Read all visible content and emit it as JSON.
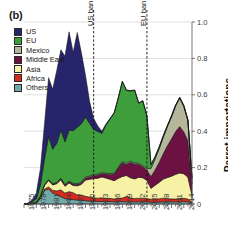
{
  "panel": {
    "label": "(b)"
  },
  "axes": {
    "y_label": "Parrot importations",
    "y_ticks": [
      "0",
      "0.2",
      "0.4",
      "0.6",
      "0.8",
      "1.0"
    ],
    "x_ticks": [
      "1975",
      "1978",
      "1981",
      "1984",
      "1987",
      "1990",
      "1993",
      "1996",
      "1999",
      "2002",
      "2005",
      "2008",
      "2011",
      "2014"
    ]
  },
  "annotations": [
    {
      "name": "us-ban",
      "text": "US ban",
      "year": 1992
    },
    {
      "name": "eu-ban",
      "text": "EU ban",
      "year": 2005
    }
  ],
  "legend": {
    "items": [
      {
        "label": "US",
        "color": "#26256b"
      },
      {
        "label": "EU",
        "color": "#3f9e3c"
      },
      {
        "label": "Mexico",
        "color": "#b6b79a"
      },
      {
        "label": "Middle East",
        "color": "#6d1142"
      },
      {
        "label": "Asia",
        "color": "#f6f1a4"
      },
      {
        "label": "Africa",
        "color": "#d62b1f"
      },
      {
        "label": "Others",
        "color": "#72aaaa"
      }
    ]
  },
  "chart_data": {
    "type": "area",
    "stacked": true,
    "title": "",
    "xlabel": "",
    "ylabel": "Parrot importations",
    "xlim": [
      1975,
      2016
    ],
    "ylim": [
      0,
      1.0
    ],
    "grid": "horizontal",
    "legend_position": "top-left",
    "x": [
      1975,
      1976,
      1977,
      1978,
      1979,
      1980,
      1981,
      1982,
      1983,
      1984,
      1985,
      1986,
      1987,
      1988,
      1989,
      1990,
      1991,
      1992,
      1993,
      1994,
      1995,
      1996,
      1997,
      1998,
      1999,
      2000,
      2001,
      2002,
      2003,
      2004,
      2005,
      2006,
      2007,
      2008,
      2009,
      2010,
      2011,
      2012,
      2013,
      2014,
      2015,
      2016
    ],
    "series": [
      {
        "name": "Others",
        "values": [
          0.0,
          0.001,
          0.002,
          0.004,
          0.03,
          0.075,
          0.082,
          0.06,
          0.052,
          0.04,
          0.03,
          0.026,
          0.024,
          0.022,
          0.02,
          0.018,
          0.016,
          0.015,
          0.014,
          0.014,
          0.013,
          0.013,
          0.012,
          0.013,
          0.013,
          0.012,
          0.012,
          0.012,
          0.012,
          0.012,
          0.012,
          0.01,
          0.01,
          0.011,
          0.012,
          0.012,
          0.012,
          0.012,
          0.013,
          0.013,
          0.012,
          0.004
        ]
      },
      {
        "name": "Africa",
        "values": [
          0.0,
          0.0,
          0.001,
          0.002,
          0.004,
          0.008,
          0.012,
          0.015,
          0.02,
          0.038,
          0.03,
          0.042,
          0.038,
          0.028,
          0.03,
          0.024,
          0.022,
          0.02,
          0.018,
          0.02,
          0.018,
          0.018,
          0.016,
          0.018,
          0.02,
          0.03,
          0.022,
          0.018,
          0.02,
          0.02,
          0.018,
          0.016,
          0.018,
          0.018,
          0.02,
          0.018,
          0.016,
          0.016,
          0.018,
          0.018,
          0.016,
          0.005
        ]
      },
      {
        "name": "Asia",
        "values": [
          0.0,
          0.0,
          0.001,
          0.003,
          0.008,
          0.02,
          0.035,
          0.03,
          0.04,
          0.055,
          0.038,
          0.048,
          0.04,
          0.05,
          0.058,
          0.09,
          0.098,
          0.105,
          0.11,
          0.115,
          0.112,
          0.105,
          0.1,
          0.11,
          0.118,
          0.115,
          0.11,
          0.108,
          0.115,
          0.112,
          0.1,
          0.06,
          0.075,
          0.09,
          0.105,
          0.115,
          0.125,
          0.135,
          0.14,
          0.135,
          0.12,
          0.04
        ]
      },
      {
        "name": "Middle East",
        "values": [
          0.0,
          0.0,
          0.0,
          0.0,
          0.001,
          0.002,
          0.003,
          0.003,
          0.004,
          0.005,
          0.005,
          0.006,
          0.006,
          0.007,
          0.008,
          0.01,
          0.012,
          0.014,
          0.016,
          0.018,
          0.02,
          0.025,
          0.035,
          0.055,
          0.075,
          0.06,
          0.085,
          0.08,
          0.07,
          0.06,
          0.055,
          0.065,
          0.085,
          0.11,
          0.14,
          0.175,
          0.205,
          0.235,
          0.255,
          0.23,
          0.2,
          0.06
        ]
      },
      {
        "name": "Mexico",
        "values": [
          0.0,
          0.0,
          0.0,
          0.0,
          0.001,
          0.002,
          0.002,
          0.003,
          0.003,
          0.004,
          0.004,
          0.004,
          0.005,
          0.005,
          0.005,
          0.006,
          0.006,
          0.006,
          0.006,
          0.006,
          0.006,
          0.006,
          0.006,
          0.006,
          0.007,
          0.007,
          0.007,
          0.007,
          0.007,
          0.007,
          0.008,
          0.045,
          0.06,
          0.075,
          0.09,
          0.105,
          0.12,
          0.14,
          0.155,
          0.14,
          0.11,
          0.03
        ]
      },
      {
        "name": "EU",
        "values": [
          0.0,
          0.002,
          0.008,
          0.02,
          0.06,
          0.14,
          0.24,
          0.19,
          0.215,
          0.265,
          0.235,
          0.28,
          0.29,
          0.31,
          0.32,
          0.33,
          0.29,
          0.25,
          0.235,
          0.215,
          0.265,
          0.3,
          0.33,
          0.38,
          0.44,
          0.4,
          0.385,
          0.4,
          0.33,
          0.355,
          0.29,
          0.02,
          0.012,
          0.01,
          0.008,
          0.006,
          0.006,
          0.005,
          0.005,
          0.005,
          0.004,
          0.002
        ]
      },
      {
        "name": "US",
        "values": [
          0.0,
          0.003,
          0.012,
          0.03,
          0.09,
          0.19,
          0.32,
          0.33,
          0.4,
          0.44,
          0.47,
          0.54,
          0.43,
          0.52,
          0.39,
          0.23,
          0.12,
          0.06,
          0.03,
          0.012,
          0.006,
          0.004,
          0.003,
          0.002,
          0.002,
          0.002,
          0.002,
          0.002,
          0.002,
          0.002,
          0.002,
          0.001,
          0.001,
          0.001,
          0.001,
          0.001,
          0.001,
          0.001,
          0.001,
          0.001,
          0.001,
          0.0
        ]
      }
    ],
    "totals_peak": {
      "us_era_peak_year": 1986,
      "us_era_peak_value": 0.84,
      "eu_era_peak_year": 1999,
      "eu_era_peak_value": 0.68,
      "late_era_peak_year": 2013,
      "late_era_peak_value": 0.65
    }
  }
}
